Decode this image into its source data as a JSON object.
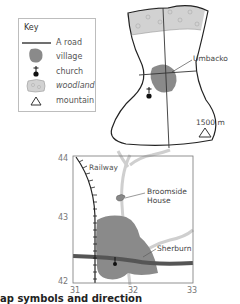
{
  "key": {
    "title": "Key",
    "items": [
      {
        "symbol": "road-line",
        "label": "A road"
      },
      {
        "symbol": "village-blob",
        "label": "village"
      },
      {
        "symbol": "church-cross",
        "label": "church"
      },
      {
        "symbol": "woodland-patch",
        "label": "woodland"
      },
      {
        "symbol": "mountain-triangle",
        "label": "mountain"
      }
    ]
  },
  "upper_map": {
    "village_label": "Umbacko",
    "mountain_label": "1500 m"
  },
  "grid_map": {
    "railway_label": "Railway",
    "house_label_line1": "Broomside",
    "house_label_line2": "House",
    "village_label": "Sherburn",
    "y_ticks": [
      "44",
      "43",
      "42"
    ],
    "x_ticks": [
      "31",
      "32",
      "33"
    ]
  },
  "caption": {
    "text": "ap symbols and direction"
  },
  "colors": {
    "village": "#8a8a8a",
    "woodland": "#d2d2d2",
    "road": "#555555",
    "minor_road": "#cfcfcf",
    "outline": "#222222"
  }
}
